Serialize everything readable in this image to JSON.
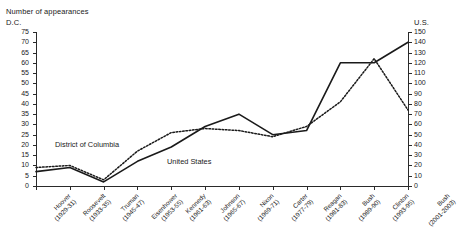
{
  "chart_data": {
    "type": "line",
    "title": "Number of appearances",
    "ylabel": "D.C.",
    "ylabel_right": "U.S.",
    "xlabel": "",
    "grid": false,
    "legend": "inline-annotations",
    "ylim": [
      0,
      75
    ],
    "ylim_right": [
      0,
      150
    ],
    "yticks": [
      0,
      5,
      10,
      15,
      20,
      25,
      30,
      35,
      40,
      45,
      50,
      55,
      60,
      65,
      70,
      75
    ],
    "yticks_right": [
      0,
      10,
      20,
      30,
      40,
      50,
      60,
      70,
      80,
      90,
      100,
      110,
      120,
      130,
      140,
      150
    ],
    "categories": [
      "Hoover (1929-31)",
      "Roosevelt (1933-35)",
      "Truman (1945-47)",
      "Eisenhower (1953-55)",
      "Kennedy (1961-63)",
      "Johnson (1965-67)",
      "Nixon (1969-71)",
      "Carter (1977-79)",
      "Reagan (1981-83)",
      "Bush (1989-90)",
      "Clinton (1993-95)",
      "Bush (2001-2003)"
    ],
    "categories_split": [
      [
        "Hoover",
        "(1929-31)"
      ],
      [
        "Roosevelt",
        "(1933-35)"
      ],
      [
        "Truman",
        "(1945-47)"
      ],
      [
        "Eisenhower",
        "(1953-55)"
      ],
      [
        "Kennedy",
        "(1961-63)"
      ],
      [
        "Johnson",
        "(1965-67)"
      ],
      [
        "Nixon",
        "(1969-71)"
      ],
      [
        "Carter",
        "(1977-79)"
      ],
      [
        "Reagan",
        "(1981-83)"
      ],
      [
        "Bush",
        "(1989-90)"
      ],
      [
        "Clinton",
        "(1993-95)"
      ],
      [
        "Bush",
        "(2001-2003)"
      ]
    ],
    "series": [
      {
        "name": "District of Columbia",
        "axis": "left",
        "style": "dotted",
        "color": "#1a1a1a",
        "values": [
          9,
          10,
          3,
          17,
          26,
          28,
          27,
          24,
          29,
          41,
          62,
          37
        ]
      },
      {
        "name": "United States",
        "axis": "right",
        "style": "solid",
        "color": "#1a1a1a",
        "values": [
          14,
          18,
          4,
          24,
          38,
          58,
          70,
          50,
          54,
          120,
          120,
          140
        ]
      }
    ],
    "annotations": [
      {
        "text": "District of Columbia",
        "series": "District of Columbia"
      },
      {
        "text": "United States",
        "series": "United States"
      }
    ]
  }
}
